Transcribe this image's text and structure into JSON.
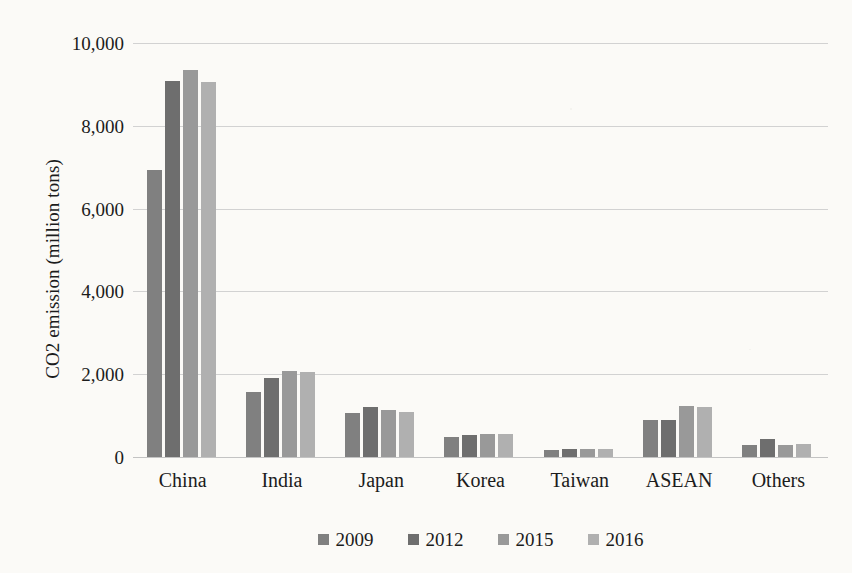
{
  "chart_data": {
    "type": "bar",
    "title": "",
    "xlabel": "",
    "ylabel": "CO2 emission (million tons)",
    "categories": [
      "China",
      "India",
      "Japan",
      "Korea",
      "Taiwan",
      "ASEAN",
      "Others"
    ],
    "series": [
      {
        "name": "2009",
        "color": "#808080",
        "values": [
          6940,
          1580,
          1060,
          480,
          180,
          900,
          280
        ]
      },
      {
        "name": "2012",
        "color": "#6e6e6e",
        "values": [
          9090,
          1900,
          1210,
          540,
          200,
          900,
          440
        ]
      },
      {
        "name": "2015",
        "color": "#999999",
        "values": [
          9350,
          2080,
          1130,
          565,
          190,
          1230,
          300
        ]
      },
      {
        "name": "2016",
        "color": "#b0b0b0",
        "values": [
          9050,
          2050,
          1090,
          560,
          185,
          1220,
          320
        ]
      }
    ],
    "ylim": [
      0,
      10000
    ],
    "yticks": [
      0,
      2000,
      4000,
      6000,
      8000,
      10000
    ],
    "ytick_labels": [
      "0",
      "2,000",
      "4,000",
      "6,000",
      "8,000",
      "10,000"
    ],
    "grid": true,
    "legend_position": "bottom",
    "legend_marker": "square"
  }
}
